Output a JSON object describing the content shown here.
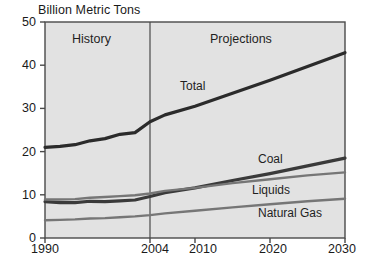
{
  "chart_data": {
    "type": "line",
    "title": "Billion Metric Tons",
    "xlabel": "",
    "ylabel": "Billion Metric Tons",
    "xlim": [
      1990,
      2030
    ],
    "ylim": [
      0,
      50
    ],
    "grid": false,
    "legend_position": "inline-annotations",
    "x_ticks": [
      1990,
      2004,
      2010,
      2020,
      2030
    ],
    "y_ticks": [
      0,
      10,
      20,
      30,
      40,
      50
    ],
    "annotations": [
      {
        "text": "History",
        "x": 1997,
        "y": 46
      },
      {
        "text": "Projections",
        "x": 2018,
        "y": 46
      }
    ],
    "divider_x": 2004,
    "series": [
      {
        "name": "Total",
        "color": "#2b2b2b",
        "label_x": 2009,
        "label_y": 34,
        "x": [
          1990,
          1992,
          1994,
          1996,
          1998,
          2000,
          2002,
          2004,
          2006,
          2010,
          2015,
          2020,
          2025,
          2030
        ],
        "values": [
          21.0,
          21.2,
          21.6,
          22.5,
          23.0,
          24.0,
          24.4,
          26.9,
          28.5,
          30.5,
          33.5,
          36.5,
          39.7,
          42.9
        ]
      },
      {
        "name": "Coal",
        "color": "#3a3a3a",
        "label_x": 2018,
        "label_y": 19.5,
        "x": [
          1990,
          1992,
          1994,
          1996,
          1998,
          2000,
          2002,
          2004,
          2006,
          2010,
          2015,
          2020,
          2025,
          2030
        ],
        "values": [
          8.4,
          8.2,
          8.2,
          8.5,
          8.4,
          8.6,
          8.8,
          9.6,
          10.5,
          11.6,
          13.3,
          14.9,
          16.7,
          18.5
        ]
      },
      {
        "name": "Liquids",
        "color": "#767676",
        "label_x": 2016,
        "label_y": 12.5,
        "x": [
          1990,
          1992,
          1994,
          1996,
          1998,
          2000,
          2002,
          2004,
          2006,
          2010,
          2015,
          2020,
          2025,
          2030
        ],
        "values": [
          8.9,
          8.9,
          9.0,
          9.3,
          9.5,
          9.7,
          9.9,
          10.3,
          10.9,
          11.6,
          12.7,
          13.6,
          14.5,
          15.2
        ]
      },
      {
        "name": "Natural Gas",
        "color": "#767676",
        "label_x": 2018,
        "label_y": 7.0,
        "x": [
          1990,
          1992,
          1994,
          1996,
          1998,
          2000,
          2002,
          2004,
          2006,
          2010,
          2015,
          2020,
          2025,
          2030
        ],
        "values": [
          4.1,
          4.2,
          4.3,
          4.5,
          4.6,
          4.8,
          5.0,
          5.3,
          5.7,
          6.3,
          7.1,
          7.8,
          8.5,
          9.1
        ]
      }
    ]
  },
  "axes": {
    "y_tick_labels": [
      "50",
      "40",
      "30",
      "20",
      "10",
      "0"
    ],
    "x_tick_labels": [
      "1990",
      "2004",
      "2010",
      "2020",
      "2030"
    ]
  },
  "labels": {
    "history": "History",
    "projections": "Projections",
    "total": "Total",
    "coal": "Coal",
    "liquids": "Liquids",
    "natural_gas": "Natural Gas"
  },
  "colors": {
    "plot_background": "#e2e2e2",
    "axis": "#4a4a4a",
    "total_line": "#2b2b2b",
    "coal_line": "#3a3a3a",
    "liquids_line": "#767676",
    "gas_line": "#767676",
    "text": "#1a1a1a"
  }
}
